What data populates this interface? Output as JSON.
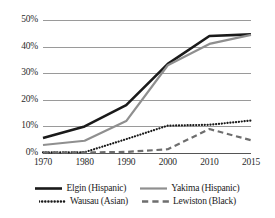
{
  "chart_data": {
    "type": "line",
    "title": "",
    "xlabel": "",
    "ylabel": "",
    "x": [
      1970,
      1980,
      1990,
      2000,
      2010,
      2015
    ],
    "x_tick_labels": [
      "1970",
      "1980",
      "1990",
      "2000",
      "2010",
      "2015"
    ],
    "y_tick_labels": [
      "0%",
      "10%",
      "20%",
      "30%",
      "40%",
      "50%"
    ],
    "y_ticks": [
      0,
      10,
      20,
      30,
      40,
      50
    ],
    "ylim": [
      0,
      50
    ],
    "grid": "horizontal",
    "legend_position": "bottom",
    "series": [
      {
        "name": "Elgin (Hispanic)",
        "values": [
          5.6,
          10.0,
          18.0,
          33.5,
          44.0,
          44.6
        ],
        "color": "#1a1a1a",
        "style": "solid",
        "width": 2.6
      },
      {
        "name": "Yakima (Hispanic)",
        "values": [
          3.0,
          4.6,
          12.0,
          33.0,
          41.0,
          44.4
        ],
        "color": "#8f8f8f",
        "style": "solid",
        "width": 2.2
      },
      {
        "name": "Wausau (Asian)",
        "values": [
          0.2,
          0.3,
          5.2,
          10.3,
          10.6,
          12.2
        ],
        "color": "#1a1a1a",
        "style": "dotted",
        "width": 2.2
      },
      {
        "name": "Lewiston (Black)",
        "values": [
          0.2,
          0.2,
          0.4,
          1.4,
          9.0,
          4.8
        ],
        "color": "#6e6e6e",
        "style": "dashed",
        "width": 2.2
      }
    ]
  },
  "legend": {
    "rows": [
      [
        {
          "label": "Elgin (Hispanic)",
          "color": "#1a1a1a",
          "style": "solid",
          "width": 2.6
        },
        {
          "label": "Yakima (Hispanic)",
          "color": "#8f8f8f",
          "style": "solid",
          "width": 2.2
        }
      ],
      [
        {
          "label": "Wausau (Asian)",
          "color": "#1a1a1a",
          "style": "dotted",
          "width": 2.4
        },
        {
          "label": "Lewiston (Black)",
          "color": "#6e6e6e",
          "style": "dashed",
          "width": 2.4
        }
      ]
    ]
  },
  "colors": {
    "gridline": "#9a9a9a",
    "axis": "#555555",
    "background": "#ffffff",
    "text": "#1a1a1a"
  }
}
